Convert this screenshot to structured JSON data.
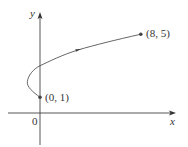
{
  "diagram": {
    "type": "parametric-curve",
    "colors": {
      "axis": "#444444",
      "curve": "#555555",
      "text": "#333333",
      "point": "#444444"
    },
    "axes": {
      "x_label": "x",
      "y_label": "y",
      "origin_label": "0"
    },
    "points": [
      {
        "label": "(0, 1)",
        "x": 0,
        "y": 1,
        "role": "start"
      },
      {
        "label": "(8, 5)",
        "x": 8,
        "y": 5,
        "role": "end"
      }
    ],
    "curve": {
      "description": "curve from (0,1) looping left to about (-1,2), crossing y-axis at (0,3), ending at (8,5); direction arrow mid-curve",
      "samples": [
        [
          0,
          1
        ],
        [
          -0.75,
          1.5
        ],
        [
          -1,
          2
        ],
        [
          -0.75,
          2.5
        ],
        [
          0,
          3
        ],
        [
          1.25,
          3.5
        ],
        [
          3,
          4
        ],
        [
          5.25,
          4.5
        ],
        [
          8,
          5
        ]
      ]
    }
  }
}
